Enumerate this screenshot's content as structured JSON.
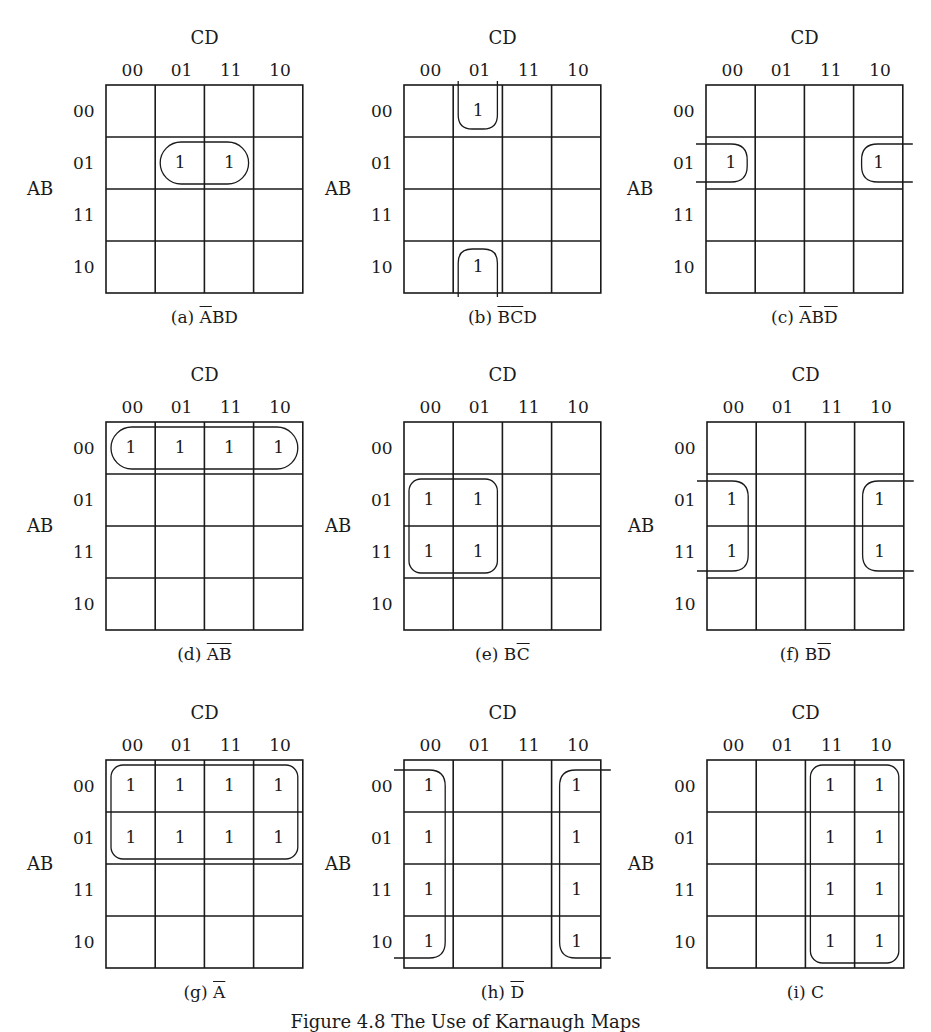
{
  "figure": {
    "caption": "Figure 4.8  The Use of Karnaugh Maps",
    "col_var": "CD",
    "row_var": "AB",
    "col_codes": [
      "00",
      "01",
      "11",
      "10"
    ],
    "row_codes": [
      "00",
      "01",
      "11",
      "10"
    ]
  },
  "maps": [
    {
      "id": "a",
      "label": "(a)",
      "expr_parts": [
        {
          "t": "A",
          "bar": true
        },
        {
          "t": "BD",
          "bar": false
        }
      ],
      "ones": [
        [
          1,
          1
        ],
        [
          1,
          2
        ]
      ],
      "pos": {
        "x": 0,
        "y": 0
      },
      "groups": [
        {
          "shape": "rect",
          "r0": 1,
          "r1": 1,
          "c0": 1,
          "c1": 2
        }
      ]
    },
    {
      "id": "b",
      "label": "(b)",
      "expr_parts": [
        {
          "t": "B",
          "bar": true
        },
        {
          "t": "C",
          "bar": true
        },
        {
          "t": "D",
          "bar": false
        }
      ],
      "ones": [
        [
          0,
          1
        ],
        [
          3,
          1
        ]
      ],
      "pos": {
        "x": 298,
        "y": 0
      },
      "groups": [
        {
          "shape": "wrap-vertical",
          "col": 1
        }
      ]
    },
    {
      "id": "c",
      "label": "(c)",
      "expr_parts": [
        {
          "t": "A",
          "bar": true
        },
        {
          "t": "B",
          "bar": false
        },
        {
          "t": "D",
          "bar": true
        }
      ],
      "ones": [
        [
          1,
          0
        ],
        [
          1,
          3
        ]
      ],
      "pos": {
        "x": 600,
        "y": 0
      },
      "groups": [
        {
          "shape": "wrap-horizontal",
          "r0": 1,
          "r1": 1
        }
      ]
    },
    {
      "id": "d",
      "label": "(d)",
      "expr_parts": [
        {
          "t": "A",
          "bar": true
        },
        {
          "t": "B",
          "bar": true
        }
      ],
      "ones": [
        [
          0,
          0
        ],
        [
          0,
          1
        ],
        [
          0,
          2
        ],
        [
          0,
          3
        ]
      ],
      "pos": {
        "x": 0,
        "y": 337
      },
      "groups": [
        {
          "shape": "rect",
          "r0": 0,
          "r1": 0,
          "c0": 0,
          "c1": 3
        }
      ]
    },
    {
      "id": "e",
      "label": "(e)",
      "expr_parts": [
        {
          "t": "B",
          "bar": false
        },
        {
          "t": "C",
          "bar": true
        }
      ],
      "ones": [
        [
          1,
          0
        ],
        [
          1,
          1
        ],
        [
          2,
          0
        ],
        [
          2,
          1
        ]
      ],
      "pos": {
        "x": 298,
        "y": 337
      },
      "groups": [
        {
          "shape": "rect",
          "r0": 1,
          "r1": 2,
          "c0": 0,
          "c1": 1
        }
      ]
    },
    {
      "id": "f",
      "label": "(f)",
      "expr_parts": [
        {
          "t": "B",
          "bar": false
        },
        {
          "t": "D",
          "bar": true
        }
      ],
      "ones": [
        [
          1,
          0
        ],
        [
          2,
          0
        ],
        [
          1,
          3
        ],
        [
          2,
          3
        ]
      ],
      "pos": {
        "x": 601,
        "y": 337
      },
      "groups": [
        {
          "shape": "wrap-horizontal",
          "r0": 1,
          "r1": 2
        }
      ]
    },
    {
      "id": "g",
      "label": "(g)",
      "expr_parts": [
        {
          "t": "A",
          "bar": true
        }
      ],
      "ones": [
        [
          0,
          0
        ],
        [
          0,
          1
        ],
        [
          0,
          2
        ],
        [
          0,
          3
        ],
        [
          1,
          0
        ],
        [
          1,
          1
        ],
        [
          1,
          2
        ],
        [
          1,
          3
        ]
      ],
      "pos": {
        "x": 0,
        "y": 675
      },
      "groups": [
        {
          "shape": "rect",
          "r0": 0,
          "r1": 1,
          "c0": 0,
          "c1": 3
        }
      ]
    },
    {
      "id": "h",
      "label": "(h)",
      "expr_parts": [
        {
          "t": "D",
          "bar": true
        }
      ],
      "ones": [
        [
          0,
          0
        ],
        [
          1,
          0
        ],
        [
          2,
          0
        ],
        [
          3,
          0
        ],
        [
          0,
          3
        ],
        [
          1,
          3
        ],
        [
          2,
          3
        ],
        [
          3,
          3
        ]
      ],
      "pos": {
        "x": 298,
        "y": 675
      },
      "groups": [
        {
          "shape": "wrap-horizontal",
          "r0": 0,
          "r1": 3
        }
      ]
    },
    {
      "id": "i",
      "label": "(i)",
      "expr_parts": [
        {
          "t": "C",
          "bar": false
        }
      ],
      "ones": [
        [
          0,
          2
        ],
        [
          0,
          3
        ],
        [
          1,
          2
        ],
        [
          1,
          3
        ],
        [
          2,
          2
        ],
        [
          2,
          3
        ],
        [
          3,
          2
        ],
        [
          3,
          3
        ]
      ],
      "pos": {
        "x": 601,
        "y": 675
      },
      "groups": [
        {
          "shape": "rect",
          "r0": 0,
          "r1": 3,
          "c0": 2,
          "c1": 3
        }
      ]
    }
  ]
}
